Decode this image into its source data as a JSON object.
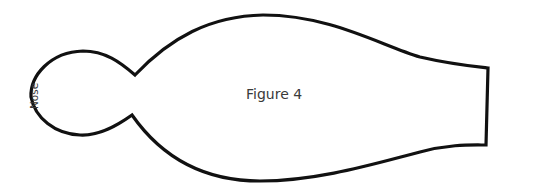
{
  "figure": {
    "caption": "Figure 4",
    "labels": {
      "nose": "Nose"
    },
    "outline_color": "#111111",
    "background_color": "#ffffff"
  }
}
